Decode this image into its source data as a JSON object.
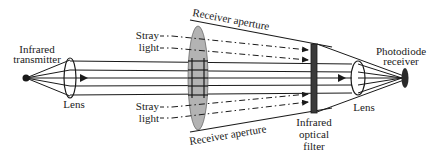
{
  "diagram": {
    "labels": {
      "transmitter_line1": "Infrared",
      "transmitter_line2": "transmitter",
      "lens_left": "Lens",
      "stray_top_line1": "Stray",
      "stray_top_line2": "light",
      "stray_bottom_line1": "Stray",
      "stray_bottom_line2": "light",
      "aperture_top": "Receiver aperture",
      "aperture_bottom": "Receiver aperture",
      "filter_line1": "Infrared",
      "filter_line2": "optical",
      "filter_line3": "filter",
      "lens_right": "Lens",
      "receiver_line1": "Photodiode",
      "receiver_line2": "receiver"
    },
    "colors": {
      "line": "#1a1a1a",
      "lens_fill": "#b3b3b3",
      "filter_fill": "#3a3a3a",
      "background": "#ffffff"
    }
  }
}
